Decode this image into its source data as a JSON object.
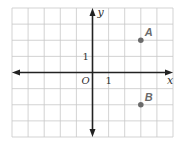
{
  "chart_data": {
    "type": "scatter",
    "title": "",
    "xlabel": "x",
    "ylabel": "y",
    "origin_label": "O",
    "xlim": [
      -5,
      5
    ],
    "ylim": [
      -4,
      4
    ],
    "grid": true,
    "tick_labels": {
      "x": [
        {
          "value": 1,
          "label": "1"
        }
      ],
      "y": [
        {
          "value": 1,
          "label": "1"
        }
      ]
    },
    "points": [
      {
        "name": "A",
        "x": 3,
        "y": 2
      },
      {
        "name": "B",
        "x": 3,
        "y": -2
      }
    ],
    "colors": {
      "grid": "#c8c8c8",
      "axis": "#222222",
      "point": "#6b6b6b"
    }
  }
}
